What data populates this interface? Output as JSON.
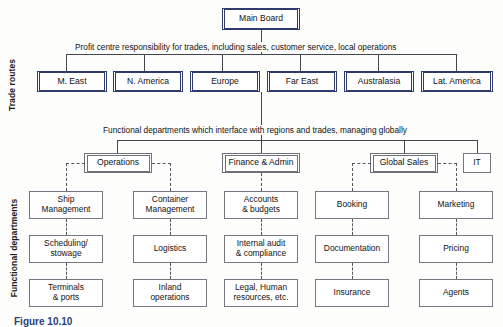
{
  "figure": {
    "caption": "Figure 10.10"
  },
  "side_labels": {
    "trade_routes": "Trade routes",
    "functional_departments": "Functional departments"
  },
  "board": {
    "label": "Main Board"
  },
  "bus_notes": {
    "trade_routes": "Profit centre responsibility for trades, including sales, customer service, local operations",
    "functional": "Functional departments which interface with regions and trades, managing globally"
  },
  "trade_routes": [
    {
      "label": "M. East"
    },
    {
      "label": "N. America"
    },
    {
      "label": "Europe"
    },
    {
      "label": "Far East"
    },
    {
      "label": "Australasia"
    },
    {
      "label": "Lat. America"
    }
  ],
  "departments": [
    {
      "label": "Operations"
    },
    {
      "label": "Finance & Admin"
    },
    {
      "label": "Global Sales"
    },
    {
      "label": "IT"
    }
  ],
  "columns": [
    {
      "parent": "Operations",
      "items": [
        {
          "line1": "Ship",
          "line2": "Management"
        },
        {
          "line1": "Scheduling/",
          "line2": "stowage"
        },
        {
          "line1": "Terminals",
          "line2": "& ports"
        }
      ]
    },
    {
      "parent": "Operations",
      "items": [
        {
          "line1": "Container",
          "line2": "Management"
        },
        {
          "line1": "Logistics",
          "line2": ""
        },
        {
          "line1": "Inland",
          "line2": "operations"
        }
      ]
    },
    {
      "parent": "Finance & Admin",
      "items": [
        {
          "line1": "Accounts",
          "line2": "& budgets"
        },
        {
          "line1": "Internal audit",
          "line2": "& compliance"
        },
        {
          "line1": "Legal, Human",
          "line2": "resources, etc."
        }
      ]
    },
    {
      "parent": "Global Sales",
      "items": [
        {
          "line1": "Booking",
          "line2": ""
        },
        {
          "line1": "Documentation",
          "line2": ""
        },
        {
          "line1": "Insurance",
          "line2": ""
        }
      ]
    },
    {
      "parent": "Global Sales",
      "items": [
        {
          "line1": "Marketing",
          "line2": ""
        },
        {
          "line1": "Pricing",
          "line2": ""
        },
        {
          "line1": "Agents",
          "line2": ""
        }
      ]
    }
  ],
  "colors": {
    "navy_border": "#2e3b6b",
    "grey_border": "#6f6f78",
    "line": "#45454d",
    "caption": "#2b3f73",
    "background": "#fdfdfc"
  }
}
